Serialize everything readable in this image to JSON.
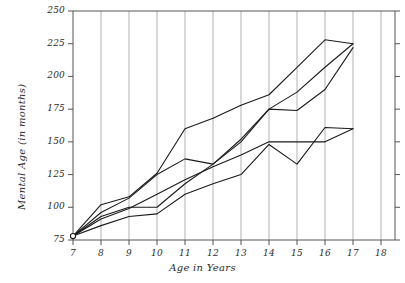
{
  "chart_data": {
    "type": "line",
    "title": "",
    "subtitle": "",
    "xlabel": "Age in Years",
    "ylabel": "Mental Age (in months)",
    "xlim": [
      7,
      18
    ],
    "ylim": [
      75,
      250
    ],
    "x_ticks": [
      7,
      8,
      9,
      10,
      11,
      12,
      13,
      14,
      15,
      16,
      17,
      18
    ],
    "y_ticks": [
      75,
      100,
      125,
      150,
      175,
      200,
      225,
      250
    ],
    "x_tick_labels": [
      "7",
      "8",
      "9",
      "10",
      "11",
      "12",
      "13",
      "14",
      "15",
      "16",
      "17",
      "18"
    ],
    "y_tick_labels": [
      "75",
      "100",
      "125",
      "150",
      "175",
      "200",
      "225",
      "250"
    ],
    "grid": "vertical-only",
    "legend": "none",
    "marker_note": "open circle at common origin (7, 78)",
    "line_color": "#1a1a1a",
    "grid_color": "#a9a9a9",
    "series": [
      {
        "name": "Case A",
        "x": [
          7,
          8,
          9,
          10,
          11,
          12,
          13,
          14,
          15,
          16,
          17
        ],
        "values": [
          78,
          102,
          108,
          126,
          160,
          168,
          178,
          186,
          207,
          228,
          225
        ]
      },
      {
        "name": "Case B",
        "x": [
          7,
          8,
          9,
          10,
          11,
          12,
          13,
          14,
          15,
          16,
          17
        ],
        "values": [
          78,
          96,
          107,
          125,
          137,
          133,
          152,
          175,
          174,
          190,
          222
        ]
      },
      {
        "name": "Case C",
        "x": [
          7,
          8,
          9,
          10,
          11,
          12,
          13,
          14,
          15,
          16,
          17
        ],
        "values": [
          78,
          93,
          100,
          100,
          118,
          133,
          150,
          175,
          188,
          207,
          225
        ]
      },
      {
        "name": "Case D",
        "x": [
          7,
          8,
          9,
          10,
          11,
          12,
          13,
          14,
          15,
          16,
          17
        ],
        "values": [
          78,
          91,
          99,
          110,
          121,
          131,
          140,
          150,
          150,
          150,
          160
        ]
      },
      {
        "name": "Case E",
        "x": [
          7,
          8,
          9,
          10,
          11,
          12,
          13,
          14,
          15,
          16,
          17
        ],
        "values": [
          78,
          86,
          93,
          95,
          110,
          118,
          125,
          148,
          133,
          161,
          160
        ]
      }
    ]
  }
}
